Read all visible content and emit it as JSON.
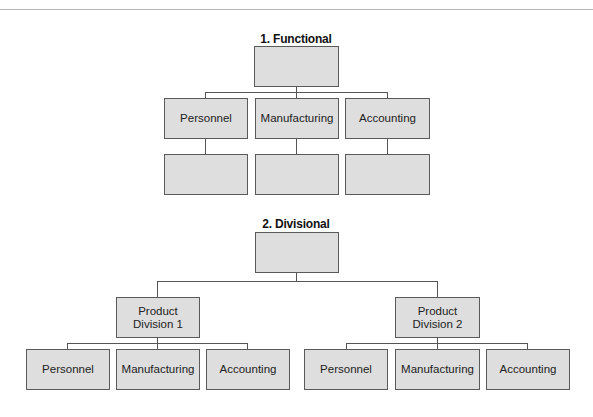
{
  "header": {
    "page_number": ""
  },
  "charts": [
    {
      "title": "1. Functional",
      "top_box": {
        "label": ""
      },
      "departments": [
        {
          "label": "Personnel",
          "sub_box": ""
        },
        {
          "label": "Manufacturing",
          "sub_box": ""
        },
        {
          "label": "Accounting",
          "sub_box": ""
        }
      ]
    },
    {
      "title": "2. Divisional",
      "top_box": {
        "label": ""
      },
      "divisions": [
        {
          "label": "Product\nDivision 1",
          "departments": [
            {
              "label": "Personnel"
            },
            {
              "label": "Manufacturing"
            },
            {
              "label": "Accounting"
            }
          ]
        },
        {
          "label": "Product\nDivision 2",
          "departments": [
            {
              "label": "Personnel"
            },
            {
              "label": "Manufacturing"
            },
            {
              "label": "Accounting"
            }
          ]
        }
      ]
    }
  ],
  "colors": {
    "box_fill": "#dedede",
    "box_border": "#5a5a5a",
    "line": "#555555"
  }
}
